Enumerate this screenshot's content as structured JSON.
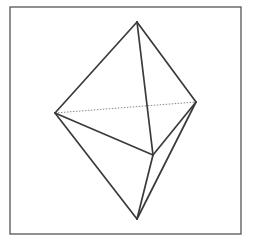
{
  "figure": {
    "frame": {
      "x1": 10,
      "y1": 7,
      "x2": 241,
      "y2": 234
    },
    "vertices": {
      "top": [
        137,
        22
      ],
      "left": [
        55,
        113
      ],
      "right": [
        196,
        102
      ],
      "middle": [
        153,
        155
      ],
      "bottom": [
        137,
        219
      ]
    },
    "edges_visible": [
      [
        "top",
        "left"
      ],
      [
        "top",
        "right"
      ],
      [
        "top",
        "middle"
      ],
      [
        "left",
        "middle"
      ],
      [
        "right",
        "middle"
      ],
      [
        "left",
        "bottom"
      ],
      [
        "middle",
        "bottom"
      ],
      [
        "right",
        "bottom"
      ]
    ],
    "edges_hidden": [
      [
        "left",
        "right"
      ]
    ],
    "colors": {
      "edge": "#3a3a3a",
      "hidden_edge": "#8a8a8a",
      "frame": "#555555",
      "background": "#ffffff"
    }
  }
}
